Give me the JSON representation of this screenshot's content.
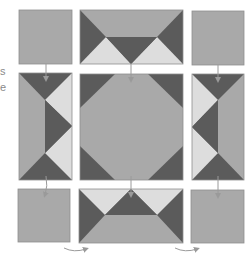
{
  "text_fragments": [
    {
      "text": "s",
      "y": 66
    },
    {
      "text": "e",
      "y": 82
    }
  ],
  "colors": {
    "dark": "#5b5b5b",
    "medium": "#a9a9a9",
    "light": "#dddddd",
    "border": "#8f8f8f",
    "arrow": "#9a9a9a"
  },
  "blocks": [
    {
      "id": "top-left",
      "type": "plain-square"
    },
    {
      "id": "top-middle",
      "type": "flying-geese-down"
    },
    {
      "id": "top-right",
      "type": "plain-square"
    },
    {
      "id": "middle-left",
      "type": "flying-geese-right"
    },
    {
      "id": "center",
      "type": "snowball-octagon"
    },
    {
      "id": "middle-right",
      "type": "flying-geese-left"
    },
    {
      "id": "bottom-left",
      "type": "plain-square"
    },
    {
      "id": "bottom-middle",
      "type": "flying-geese-up"
    },
    {
      "id": "bottom-right",
      "type": "plain-square"
    }
  ],
  "arrows": [
    {
      "id": "arrow-top-left-down"
    },
    {
      "id": "arrow-top-middle-down"
    },
    {
      "id": "arrow-top-right-down"
    },
    {
      "id": "arrow-middle-left-down"
    },
    {
      "id": "arrow-center-down"
    },
    {
      "id": "arrow-middle-right-down"
    },
    {
      "id": "arrow-bottom-left-curve"
    },
    {
      "id": "arrow-bottom-right-curve"
    }
  ]
}
